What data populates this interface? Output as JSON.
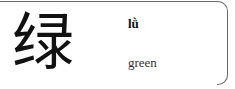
{
  "card": {
    "character": "绿",
    "pinyin": "lǜ",
    "meaning": "green"
  }
}
